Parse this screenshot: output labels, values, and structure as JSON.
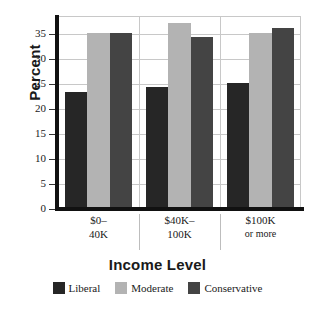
{
  "chart_data": {
    "type": "bar",
    "title": "",
    "xlabel": "Income Level",
    "ylabel": "Percent",
    "categories": [
      "$0– 40K",
      "$40K– 100K",
      "$100K or more"
    ],
    "category_lines": [
      [
        "$0–",
        "40K"
      ],
      [
        "$40K–",
        "100K"
      ],
      [
        "$100K",
        "or more"
      ]
    ],
    "series": [
      {
        "name": "Liberal",
        "color": "#262626",
        "values": [
          23.4,
          24.5,
          25.3
        ]
      },
      {
        "name": "Moderate",
        "color": "#b3b3b3",
        "values": [
          35.2,
          37.2,
          35.2
        ]
      },
      {
        "name": "Conservative",
        "color": "#444444",
        "values": [
          35.3,
          34.5,
          36.2
        ]
      }
    ],
    "ylim": [
      0,
      38.6
    ],
    "yticks": [
      0,
      5,
      10,
      15,
      20,
      25,
      30,
      35
    ],
    "ytick_labels": [
      "0",
      "5",
      "10",
      "15",
      "20",
      "25",
      "30",
      "35"
    ],
    "grid": "horizontal-and-vertical-separators",
    "legend_position": "bottom-center",
    "legend_entries": [
      "Liberal",
      "Moderate",
      "Conservative"
    ]
  },
  "colors": {
    "liberal": "#262626",
    "moderate": "#b3b3b3",
    "conservative": "#444444",
    "gridline": "#c8c8c8",
    "axis": "#111111",
    "text": "#1a1a1a",
    "background": "#ffffff"
  }
}
